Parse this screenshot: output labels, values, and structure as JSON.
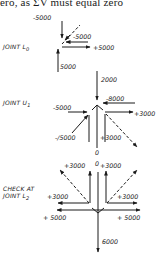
{
  "header": {
    "text": "ero, as ΣV must equal zero"
  },
  "joints": [
    {
      "label": "JOINT L",
      "subscript": "0",
      "forces": {
        "top_vertical": "-5000",
        "diagonal_inclined": "-5000",
        "horizontal_right": "+5000",
        "bottom_vertical": "5000"
      }
    },
    {
      "label": "JOINT U",
      "subscript": "1",
      "forces": {
        "top_vertical": "2000",
        "top_right": "-8000",
        "left_horizontal": "-5000",
        "right_horizontal": "+3000",
        "left_diagonal": "-/5000",
        "right_vertical": "+3000",
        "bottom_vertical": "0"
      }
    },
    {
      "label_line1": "CHECK AT",
      "label_line2": "JOINT L",
      "subscript": "2",
      "forces": {
        "top_center": "0",
        "top_left": "+3000",
        "top_right": "+3000",
        "mid_left": "+3000",
        "mid_right": "+3000",
        "bottom_left": "+ 5000",
        "bottom_right": "+ 5000",
        "bottom_vertical": "6000"
      }
    }
  ],
  "colors": {
    "ink": "#1a1a1a",
    "background": "#ffffff"
  }
}
